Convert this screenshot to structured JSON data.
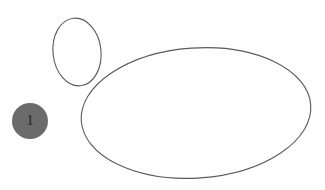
{
  "figure": {
    "background_color": "#fefefe",
    "width": 325,
    "height": 190,
    "ink_color": "#5a5a5a",
    "marker_fill_color": "#6b6b6b",
    "marker_text_color": "#242424",
    "shapes": [
      {
        "id": "small-ellipse",
        "kind": "ellipse",
        "outline": true,
        "cx": 77,
        "cy": 52,
        "rx": 24,
        "ry": 34,
        "rotation_deg": -6,
        "stroke_width": 1.1
      },
      {
        "id": "large-ellipse",
        "kind": "ellipse",
        "outline": true,
        "cx": 196,
        "cy": 113,
        "rx": 115,
        "ry": 65,
        "rotation_deg": -4,
        "stroke_width": 1.1
      }
    ],
    "markers": [
      {
        "id": "marker-1",
        "label": "1",
        "cx": 30,
        "cy": 121,
        "r": 18
      }
    ]
  }
}
